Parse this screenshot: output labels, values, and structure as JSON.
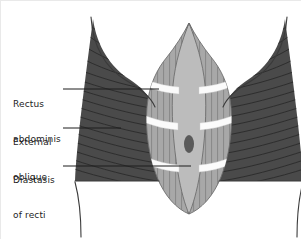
{
  "figure": {
    "type": "anatomical-diagram",
    "view": "anterior abdominal wall",
    "background_color": "#ffffff"
  },
  "labels": [
    {
      "id": "rectus",
      "name": "rectus-abdominis-label",
      "line1": "Rectus",
      "line2": "abdominis",
      "text": "Rectus abdominis",
      "leader": {
        "x1": 62,
        "y1": 88,
        "x2": 158,
        "y2": 88
      }
    },
    {
      "id": "oblique",
      "name": "external-oblique-label",
      "line1": "External",
      "line2": "oblique",
      "text": "External oblique",
      "leader": {
        "x1": 62,
        "y1": 127,
        "x2": 120,
        "y2": 127
      }
    },
    {
      "id": "diastasis",
      "name": "diastasis-of-recti-label",
      "line1": "Diastasis",
      "line2": "of recti",
      "text": "Diastasis of recti",
      "leader": {
        "x1": 62,
        "y1": 165,
        "x2": 190,
        "y2": 165
      }
    }
  ],
  "colors": {
    "external_oblique": "#4a4a4a",
    "external_oblique_striation": "#2e2e2e",
    "rectus_abdominis": "#a8a8a8",
    "rectus_striation": "#7d7d7d",
    "linea_alba_gap": "#bcbcbc",
    "tendinous_band": "#fbfbfb",
    "navel": "#5a5a5a",
    "outline": "#3a3a3a",
    "label_text": "#1d1d1d",
    "leader_line": "#1d1d1d",
    "background": "#ffffff"
  },
  "anatomy": {
    "navel": {
      "cx": 188,
      "cy": 143,
      "rx": 5,
      "ry": 9,
      "name": "umbilicus"
    },
    "rectus_apex": {
      "x": 188,
      "y": 22
    },
    "rectus_base": {
      "x": 188,
      "y": 213
    },
    "tendinous_band_rows": [
      78,
      115,
      157
    ],
    "oblique_bottom_y": 180
  }
}
